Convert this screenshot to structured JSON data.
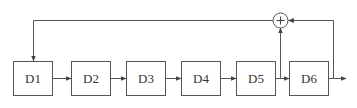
{
  "diagram": {
    "type": "shift-register-feedback",
    "blocks": [
      {
        "id": "D1",
        "label": "D1"
      },
      {
        "id": "D2",
        "label": "D2"
      },
      {
        "id": "D3",
        "label": "D3"
      },
      {
        "id": "D4",
        "label": "D4"
      },
      {
        "id": "D5",
        "label": "D5"
      },
      {
        "id": "D6",
        "label": "D6"
      }
    ],
    "adder": {
      "symbol": "+",
      "inputs": [
        "D5 output",
        "D6 output"
      ],
      "output": "D1 input"
    },
    "colors": {
      "stroke": "#555555",
      "text": "#333333",
      "background": "#ffffff"
    }
  }
}
